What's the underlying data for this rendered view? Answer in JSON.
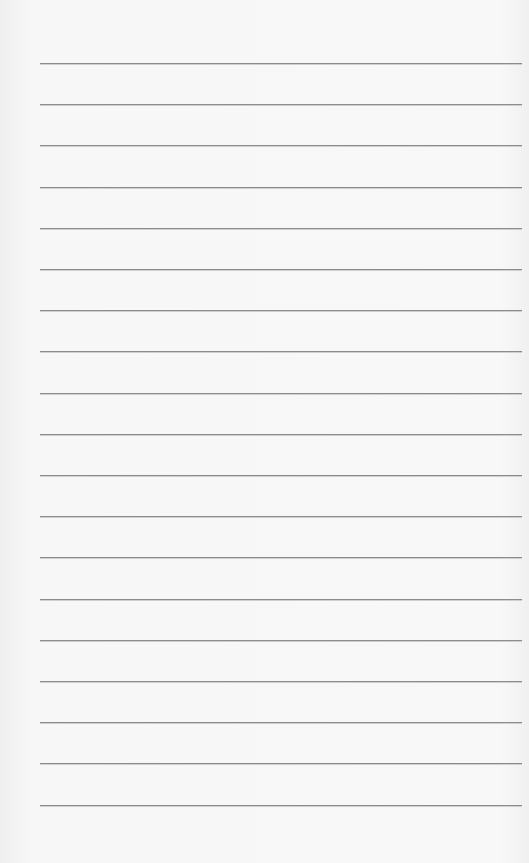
{
  "paper": {
    "style": "lined notepaper",
    "background_color": "#f6f6f6",
    "rule_color": "#8c8c8c",
    "rules": {
      "count": 19,
      "first_y": 63,
      "spacing": 41.2,
      "left": 40,
      "right": 522
    },
    "content": []
  }
}
